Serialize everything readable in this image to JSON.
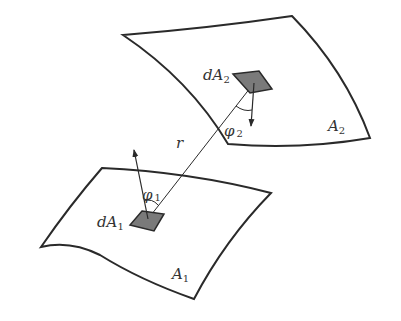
{
  "diagram": {
    "colors": {
      "stroke": "#2a2a2a",
      "patch_fill": "#7a7a7a",
      "label": "#333333",
      "background": "#ffffff"
    },
    "surfaces": [
      {
        "id": "A2",
        "label_main": "A",
        "label_sub": "2"
      },
      {
        "id": "A1",
        "label_main": "A",
        "label_sub": "1"
      }
    ],
    "patches": [
      {
        "id": "dA2",
        "label_main": "dA",
        "label_sub": "2"
      },
      {
        "id": "dA1",
        "label_main": "dA",
        "label_sub": "1"
      }
    ],
    "angles": [
      {
        "id": "phi2",
        "label_main": "φ",
        "label_sub": "2"
      },
      {
        "id": "phi1",
        "label_main": "φ",
        "label_sub": "1"
      }
    ],
    "distance": {
      "label": "r"
    }
  }
}
